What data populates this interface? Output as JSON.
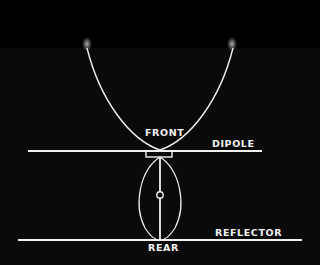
{
  "diagram": {
    "type": "antenna radiation pattern (dipole with reflector)",
    "background_color": "#000000",
    "line_color": "#f0f0f0",
    "labels": {
      "front": "FRONT",
      "dipole": "DIPOLE",
      "reflector": "REFLECTOR",
      "rear": "REAR"
    },
    "elements": [
      {
        "name": "front-lobe",
        "shape": "parabola-like open curve",
        "direction": "up"
      },
      {
        "name": "rear-lobe",
        "shape": "teardrop oval",
        "direction": "down"
      },
      {
        "name": "dipole-element",
        "shape": "horizontal line"
      },
      {
        "name": "feed-point",
        "shape": "small rectangle"
      },
      {
        "name": "boom",
        "shape": "vertical line"
      },
      {
        "name": "boom-node",
        "shape": "small circle"
      },
      {
        "name": "reflector-element",
        "shape": "horizontal line"
      }
    ]
  }
}
